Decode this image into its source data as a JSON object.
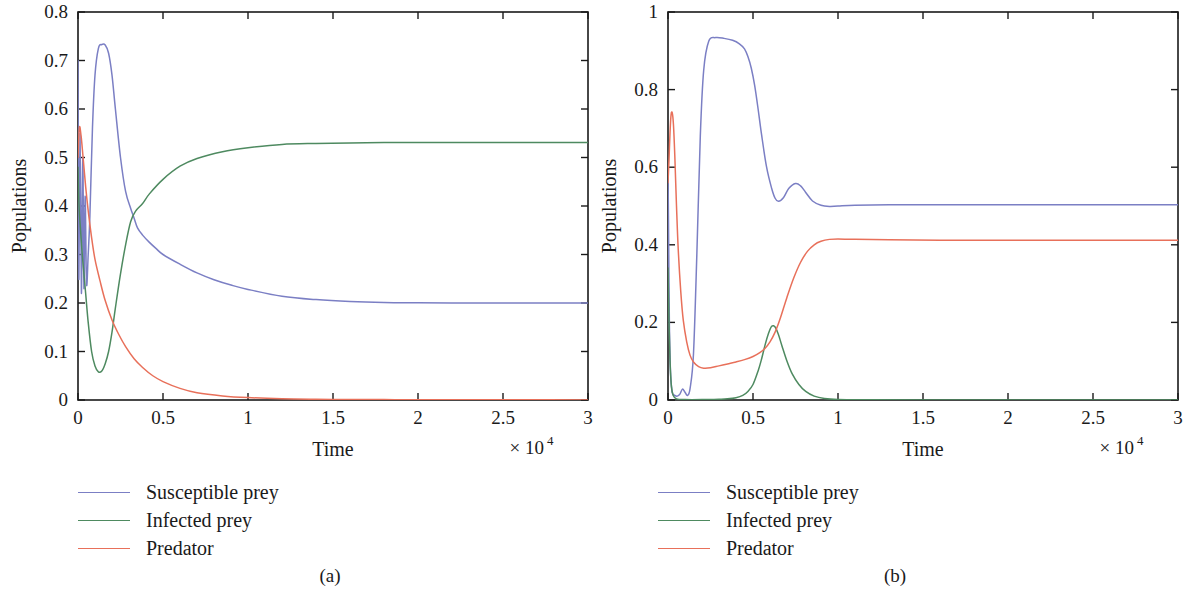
{
  "figure": {
    "title": "",
    "panels": [
      {
        "id": "a",
        "caption": "(a)",
        "xlabel": "Time",
        "ylabel": "Populations",
        "x_multiplier_prefix": "× 10",
        "x_multiplier_exponent": "4"
      },
      {
        "id": "b",
        "caption": "(b)",
        "xlabel": "Time",
        "ylabel": "Populations",
        "x_multiplier_prefix": "× 10",
        "x_multiplier_exponent": "4"
      }
    ]
  },
  "colors": {
    "susceptible_prey": "#7b7fc4",
    "infected_prey": "#4e8a60",
    "predator": "#e8705a",
    "axis": "#1a1a1a",
    "background": "#ffffff"
  },
  "legend": {
    "position": "below-axes-left",
    "entries": [
      {
        "label": "Susceptible prey",
        "color": "#7b7fc4"
      },
      {
        "label": "Infected prey",
        "color": "#4e8a60"
      },
      {
        "label": "Predator",
        "color": "#e8705a"
      }
    ]
  },
  "chart_data": [
    {
      "type": "line",
      "panel": "a",
      "title": "",
      "xlabel": "Time",
      "ylabel": "Populations",
      "x_multiplier": 10000,
      "x_multiplier_label": "× 10^4",
      "xlim": [
        0,
        3
      ],
      "ylim": [
        0,
        0.8
      ],
      "xticks": [
        0,
        0.5,
        1,
        1.5,
        2,
        2.5,
        3
      ],
      "xticklabels": [
        "0",
        "0.5",
        "1",
        "1.5",
        "2",
        "2.5",
        "3"
      ],
      "yticks": [
        0,
        0.1,
        0.2,
        0.3,
        0.4,
        0.5,
        0.6,
        0.7,
        0.8
      ],
      "yticklabels": [
        "0",
        "0.1",
        "0.2",
        "0.3",
        "0.4",
        "0.5",
        "0.6",
        "0.7",
        "0.8"
      ],
      "grid": false,
      "legend_position": "below",
      "series": [
        {
          "name": "Susceptible prey",
          "color": "#7b7fc4",
          "x": [
            0,
            0.005,
            0.012,
            0.02,
            0.028,
            0.035,
            0.042,
            0.05,
            0.06,
            0.07,
            0.085,
            0.1,
            0.12,
            0.14,
            0.16,
            0.18,
            0.2,
            0.22,
            0.25,
            0.28,
            0.31,
            0.33,
            0.35,
            0.38,
            0.42,
            0.46,
            0.5,
            0.6,
            0.7,
            0.8,
            0.9,
            1.0,
            1.2,
            1.4,
            1.6,
            1.8,
            2.0,
            2.3,
            2.6,
            3.0
          ],
          "y": [
            0.7,
            0.25,
            0.55,
            0.22,
            0.5,
            0.23,
            0.42,
            0.24,
            0.3,
            0.38,
            0.56,
            0.67,
            0.725,
            0.733,
            0.732,
            0.715,
            0.67,
            0.6,
            0.5,
            0.43,
            0.395,
            0.375,
            0.355,
            0.34,
            0.325,
            0.312,
            0.3,
            0.28,
            0.262,
            0.248,
            0.237,
            0.228,
            0.214,
            0.207,
            0.203,
            0.201,
            0.2005,
            0.2,
            0.2,
            0.2
          ]
        },
        {
          "name": "Infected prey",
          "color": "#4e8a60",
          "x": [
            0,
            0.006,
            0.015,
            0.025,
            0.035,
            0.045,
            0.06,
            0.08,
            0.1,
            0.12,
            0.14,
            0.16,
            0.18,
            0.2,
            0.22,
            0.25,
            0.28,
            0.31,
            0.34,
            0.38,
            0.42,
            0.5,
            0.6,
            0.7,
            0.85,
            1.0,
            1.2,
            1.4,
            1.6,
            1.8,
            2.0,
            2.3,
            2.6,
            3.0
          ],
          "y": [
            0.48,
            0.4,
            0.35,
            0.3,
            0.26,
            0.22,
            0.16,
            0.1,
            0.07,
            0.058,
            0.06,
            0.075,
            0.1,
            0.14,
            0.19,
            0.26,
            0.32,
            0.368,
            0.39,
            0.405,
            0.425,
            0.455,
            0.482,
            0.498,
            0.512,
            0.52,
            0.527,
            0.529,
            0.53,
            0.531,
            0.531,
            0.531,
            0.531,
            0.531
          ]
        },
        {
          "name": "Predator",
          "color": "#e8705a",
          "x": [
            0,
            0.008,
            0.018,
            0.03,
            0.045,
            0.06,
            0.08,
            0.1,
            0.13,
            0.16,
            0.2,
            0.24,
            0.28,
            0.33,
            0.38,
            0.44,
            0.5,
            0.6,
            0.7,
            0.85,
            1.0,
            1.2,
            1.4,
            1.6,
            1.8,
            2.0,
            2.3,
            2.6,
            3.0
          ],
          "y": [
            0.5,
            0.562,
            0.545,
            0.5,
            0.44,
            0.39,
            0.335,
            0.29,
            0.245,
            0.205,
            0.165,
            0.135,
            0.11,
            0.085,
            0.067,
            0.05,
            0.038,
            0.024,
            0.015,
            0.0085,
            0.005,
            0.0025,
            0.0015,
            0.001,
            0.0008,
            0.0006,
            0.0004,
            0.0003,
            0.0002
          ]
        }
      ]
    },
    {
      "type": "line",
      "panel": "b",
      "title": "",
      "xlabel": "Time",
      "ylabel": "Populations",
      "x_multiplier": 10000,
      "x_multiplier_label": "× 10^4",
      "xlim": [
        0,
        3
      ],
      "ylim": [
        0,
        1
      ],
      "xticks": [
        0,
        0.5,
        1,
        1.5,
        2,
        2.5,
        3
      ],
      "xticklabels": [
        "0",
        "0.5",
        "1",
        "1.5",
        "2",
        "2.5",
        "3"
      ],
      "yticks": [
        0,
        0.2,
        0.4,
        0.6,
        0.8,
        1
      ],
      "yticklabels": [
        "0",
        "0.2",
        "0.4",
        "0.6",
        "0.8",
        "1"
      ],
      "grid": false,
      "legend_position": "below",
      "series": [
        {
          "name": "Susceptible prey",
          "color": "#7b7fc4",
          "x": [
            0,
            0.004,
            0.008,
            0.015,
            0.025,
            0.04,
            0.055,
            0.07,
            0.085,
            0.1,
            0.115,
            0.13,
            0.15,
            0.17,
            0.19,
            0.21,
            0.24,
            0.28,
            0.33,
            0.38,
            0.42,
            0.45,
            0.47,
            0.49,
            0.51,
            0.53,
            0.55,
            0.58,
            0.61,
            0.63,
            0.65,
            0.68,
            0.71,
            0.75,
            0.78,
            0.81,
            0.85,
            0.9,
            0.95,
            1.0,
            1.1,
            1.3,
            1.6,
            2.0,
            2.5,
            3.0
          ],
          "y": [
            0.6,
            0.4,
            0.2,
            0.07,
            0.02,
            0.012,
            0.01,
            0.015,
            0.028,
            0.02,
            0.012,
            0.03,
            0.12,
            0.38,
            0.68,
            0.85,
            0.925,
            0.934,
            0.932,
            0.927,
            0.918,
            0.905,
            0.885,
            0.855,
            0.81,
            0.75,
            0.685,
            0.6,
            0.545,
            0.52,
            0.512,
            0.522,
            0.545,
            0.558,
            0.552,
            0.535,
            0.513,
            0.502,
            0.499,
            0.5,
            0.502,
            0.503,
            0.503,
            0.503,
            0.503,
            0.503
          ]
        },
        {
          "name": "Infected prey",
          "color": "#4e8a60",
          "x": [
            0,
            0.006,
            0.012,
            0.02,
            0.03,
            0.05,
            0.1,
            0.2,
            0.3,
            0.35,
            0.4,
            0.44,
            0.47,
            0.5,
            0.53,
            0.55,
            0.57,
            0.59,
            0.61,
            0.63,
            0.65,
            0.67,
            0.7,
            0.73,
            0.77,
            0.81,
            0.86,
            0.92,
            1.0,
            1.2,
            1.5,
            2.0,
            2.5,
            3.0
          ],
          "y": [
            0.34,
            0.2,
            0.1,
            0.035,
            0.012,
            0.003,
            0.001,
            0.001,
            0.002,
            0.003,
            0.006,
            0.012,
            0.022,
            0.04,
            0.075,
            0.105,
            0.14,
            0.17,
            0.19,
            0.188,
            0.168,
            0.14,
            0.1,
            0.068,
            0.04,
            0.022,
            0.01,
            0.004,
            0.0015,
            0.0005,
            0.0002,
            0.0001,
            0.0001,
            0.0001
          ]
        },
        {
          "name": "Predator",
          "color": "#e8705a",
          "x": [
            0,
            0.006,
            0.012,
            0.018,
            0.025,
            0.032,
            0.04,
            0.05,
            0.06,
            0.075,
            0.09,
            0.11,
            0.13,
            0.15,
            0.18,
            0.21,
            0.25,
            0.3,
            0.35,
            0.4,
            0.45,
            0.5,
            0.54,
            0.57,
            0.6,
            0.63,
            0.66,
            0.7,
            0.74,
            0.78,
            0.82,
            0.86,
            0.9,
            0.95,
            1.0,
            1.1,
            1.3,
            1.6,
            2.0,
            2.5,
            3.0
          ],
          "y": [
            0.56,
            0.62,
            0.69,
            0.735,
            0.74,
            0.71,
            0.63,
            0.5,
            0.39,
            0.28,
            0.205,
            0.15,
            0.115,
            0.098,
            0.086,
            0.082,
            0.083,
            0.088,
            0.093,
            0.098,
            0.104,
            0.112,
            0.122,
            0.133,
            0.15,
            0.175,
            0.21,
            0.265,
            0.315,
            0.355,
            0.383,
            0.4,
            0.409,
            0.414,
            0.415,
            0.414,
            0.413,
            0.412,
            0.412,
            0.412,
            0.412
          ]
        }
      ]
    }
  ]
}
